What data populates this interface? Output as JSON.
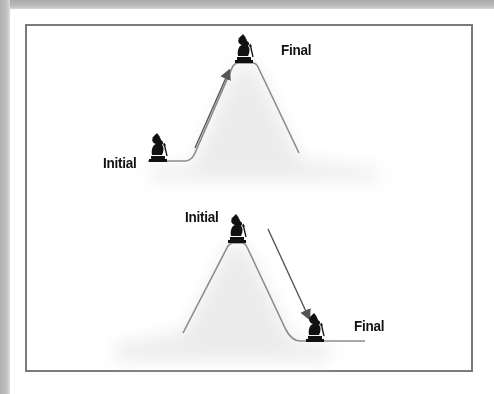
{
  "diagram": {
    "title": "",
    "panels": [
      {
        "id": "uphill",
        "initial_label": "Initial",
        "final_label": "Final",
        "description": "Figure moves from low baseline to top of hill"
      },
      {
        "id": "downhill",
        "initial_label": "Initial",
        "final_label": "Final",
        "description": "Figure moves from top of hill down to low baseline"
      }
    ],
    "icons": {
      "figure": "hiker-figure-icon",
      "arrow": "arrow-icon"
    },
    "colors": {
      "line": "#8c8c8c",
      "arrow": "#555555",
      "frame": "#7a7a7a",
      "figure": "#111111",
      "shadow": "#e6e6e6"
    }
  }
}
